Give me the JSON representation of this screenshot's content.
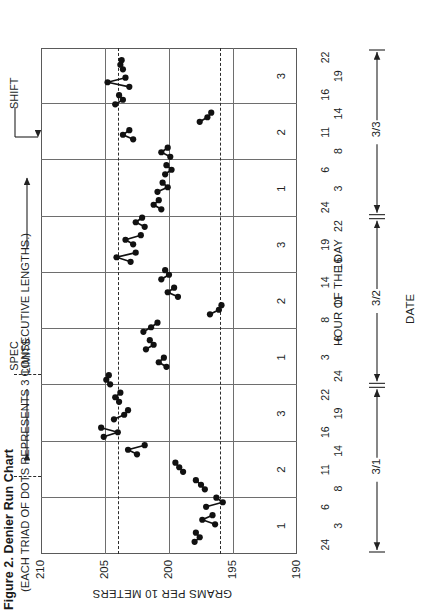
{
  "figure": {
    "title": "Figure 2. Denier Run Chart",
    "subtitle": "(EACH TRIAD OF DOTS REPRESENTS 3 CONSECUTIVE LENGTHS.)"
  },
  "annotations": {
    "spec_limits_label": "SPEC\nLIMITS",
    "spec_limits_line1": "SPEC",
    "spec_limits_line2": "LIMITS",
    "shift_label": "SHIFT"
  },
  "axes": {
    "y_title": "GRAMS PER 10 METERS",
    "x_title": "HOUR OF THE DAY",
    "date_title": "DATE",
    "y_ticks": [
      "190",
      "195",
      "200",
      "205",
      "210"
    ],
    "x_hour_ticks": [
      "24",
      "3",
      "6",
      "8",
      "11",
      "14",
      "16",
      "19",
      "22",
      "24",
      "3",
      "6",
      "8",
      "11",
      "14",
      "16",
      "19",
      "22",
      "24",
      "3",
      "6",
      "8",
      "11",
      "14",
      "16",
      "19",
      "22"
    ],
    "shift_numbers": [
      "1",
      "2",
      "3",
      "1",
      "2",
      "3",
      "1",
      "2",
      "3"
    ],
    "date_spans": [
      "3/1",
      "3/2",
      "3/3"
    ]
  },
  "chart_data": {
    "type": "line",
    "title": "Figure 2. Denier Run Chart",
    "subtitle": "(EACH TRIAD OF DOTS REPRESENTS 3 CONSECUTIVE LENGTHS.)",
    "xlabel": "HOUR OF THE DAY",
    "ylabel": "GRAMS PER 10 METERS",
    "ylim": [
      190,
      210
    ],
    "y_ticks": [
      190,
      195,
      200,
      205,
      210
    ],
    "grid": true,
    "legend": "none",
    "orientation": "rotated-90-ccw",
    "spec_limits": {
      "upper": 204,
      "lower": 196,
      "style": "dashed"
    },
    "shift_boundaries": [
      1,
      2,
      3,
      4,
      5,
      6,
      7,
      8
    ],
    "x_hour_ticks": [
      "24",
      "3",
      "6",
      "8",
      "11",
      "14",
      "16",
      "19",
      "22",
      "24",
      "3",
      "6",
      "8",
      "11",
      "14",
      "16",
      "19",
      "22",
      "24",
      "3",
      "6",
      "8",
      "11",
      "14",
      "16",
      "19",
      "22"
    ],
    "shifts": [
      {
        "shift": "1",
        "date": "3/1"
      },
      {
        "shift": "2",
        "date": "3/1"
      },
      {
        "shift": "3",
        "date": "3/1"
      },
      {
        "shift": "1",
        "date": "3/2"
      },
      {
        "shift": "2",
        "date": "3/2"
      },
      {
        "shift": "3",
        "date": "3/2"
      },
      {
        "shift": "1",
        "date": "3/3"
      },
      {
        "shift": "2",
        "date": "3/3"
      },
      {
        "shift": "3",
        "date": "3/3"
      }
    ],
    "triads": [
      {
        "index": 0,
        "shift": 1,
        "values": [
          198.0,
          197.6,
          197.9
        ]
      },
      {
        "index": 1,
        "shift": 1,
        "values": [
          196.4,
          197.4,
          196.6
        ]
      },
      {
        "index": 2,
        "shift": 1,
        "values": [
          197.1,
          195.8,
          196.3
        ]
      },
      {
        "index": 3,
        "shift": 1,
        "values": [
          197.2,
          197.5,
          197.9
        ]
      },
      {
        "index": 4,
        "shift": 2,
        "values": [
          198.9,
          199.2,
          199.5
        ]
      },
      {
        "index": 5,
        "shift": 2,
        "values": [
          202.5,
          203.2,
          201.9
        ]
      },
      {
        "index": 6,
        "shift": 3,
        "values": [
          205.1,
          204.0,
          205.3
        ]
      },
      {
        "index": 7,
        "shift": 3,
        "values": [
          204.3,
          203.5,
          203.2
        ]
      },
      {
        "index": 8,
        "shift": 3,
        "values": [
          203.9,
          204.2,
          203.8
        ]
      },
      {
        "index": 9,
        "shift": 3,
        "values": [
          204.6,
          204.9,
          204.7
        ]
      },
      {
        "index": 10,
        "shift": 1,
        "values": [
          200.2,
          200.8,
          200.4
        ]
      },
      {
        "index": 11,
        "shift": 1,
        "values": [
          201.8,
          201.2,
          201.5
        ]
      },
      {
        "index": 12,
        "shift": 1,
        "values": [
          202.0,
          201.4,
          200.9
        ]
      },
      {
        "index": 13,
        "shift": 2,
        "values": [
          196.8,
          196.1,
          195.9
        ]
      },
      {
        "index": 14,
        "shift": 2,
        "values": [
          199.3,
          200.1,
          199.6
        ]
      },
      {
        "index": 15,
        "shift": 2,
        "values": [
          200.6,
          200.0,
          200.3
        ]
      },
      {
        "index": 16,
        "shift": 3,
        "values": [
          203.0,
          204.1,
          202.6
        ]
      },
      {
        "index": 17,
        "shift": 3,
        "values": [
          202.8,
          203.4,
          202.2
        ]
      },
      {
        "index": 18,
        "shift": 3,
        "values": [
          201.9,
          202.6,
          202.1
        ]
      },
      {
        "index": 19,
        "shift": 3,
        "values": [
          200.6,
          201.2,
          200.8
        ]
      },
      {
        "index": 20,
        "shift": 1,
        "values": [
          200.9,
          200.1,
          200.5
        ]
      },
      {
        "index": 21,
        "shift": 1,
        "values": [
          200.3,
          199.8,
          200.2
        ]
      },
      {
        "index": 22,
        "shift": 1,
        "values": [
          199.9,
          200.6,
          200.1
        ]
      },
      {
        "index": 23,
        "shift": 2,
        "values": [
          202.8,
          203.6,
          203.1
        ]
      },
      {
        "index": 24,
        "shift": 2,
        "values": [
          197.6,
          197.0,
          196.7
        ]
      },
      {
        "index": 25,
        "shift": 3,
        "values": [
          204.2,
          203.6,
          203.9
        ]
      },
      {
        "index": 26,
        "shift": 3,
        "values": [
          203.1,
          204.8,
          203.4
        ]
      },
      {
        "index": 27,
        "shift": 3,
        "values": [
          203.6,
          203.8,
          203.7
        ]
      }
    ]
  },
  "colors": {
    "marker": "#111111",
    "line": "#111111",
    "grid": "#6e6e6e",
    "border": "#5a5a5a",
    "spec": "#2b2b2b",
    "text": "#221f1f"
  }
}
